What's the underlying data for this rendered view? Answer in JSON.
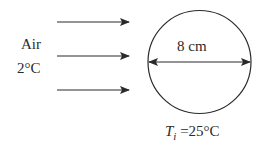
{
  "fluid": {
    "name": "Air",
    "temperature": "2°C"
  },
  "sphere": {
    "diameter_label": "8 cm",
    "initial_temp_symbol": "T",
    "initial_temp_subscript": "i",
    "initial_temp_value": " =25°C"
  },
  "flow_arrows": 3,
  "colors": {
    "stroke": "#2a2a2a",
    "background": "#ffffff"
  }
}
